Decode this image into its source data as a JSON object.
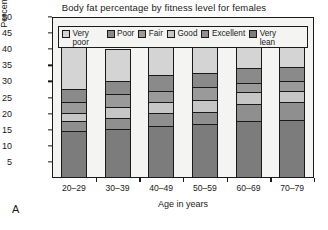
{
  "panel_label": "A",
  "chart_data": {
    "type": "bar",
    "stacked": true,
    "title": "Body fat percentage by fitness level for females",
    "xlabel": "Age in years",
    "ylabel": "Percent body fat",
    "categories": [
      "20–29",
      "30–39",
      "40–49",
      "50–59",
      "60–69",
      "70–79"
    ],
    "ylim": [
      0,
      50
    ],
    "yticks": [
      5,
      10,
      15,
      20,
      25,
      30,
      35,
      40,
      45,
      50
    ],
    "ytick_labels": [
      "5",
      "10",
      "15",
      "20",
      "25",
      "30",
      "35",
      "40",
      "45",
      "50"
    ],
    "grid": false,
    "legend_position": "top-inside",
    "series": [
      {
        "name": "Very lean",
        "color": "#7c7c7c",
        "values": [
          14.0,
          14.5,
          15.5,
          16.0,
          17.0,
          17.5
        ]
      },
      {
        "name": "Excellent",
        "color": "#8f8f8f",
        "values": [
          3.0,
          3.5,
          4.0,
          4.0,
          5.5,
          5.5
        ]
      },
      {
        "name": "Good",
        "color": "#c6c6c6",
        "values": [
          2.5,
          3.5,
          3.5,
          3.5,
          3.5,
          3.5
        ]
      },
      {
        "name": "Fair",
        "color": "#9a9a9a",
        "values": [
          3.5,
          4.0,
          3.5,
          4.0,
          3.0,
          3.0
        ]
      },
      {
        "name": "Poor",
        "color": "#8a8a8a",
        "values": [
          4.0,
          4.0,
          5.0,
          4.5,
          4.5,
          4.5
        ]
      },
      {
        "name": "Very poor",
        "color": "#d4d4d4",
        "values": [
          13.0,
          10.0,
          9.0,
          8.0,
          6.5,
          6.0
        ]
      }
    ],
    "legend": [
      {
        "label": "Very poor",
        "color": "#d4d4d4"
      },
      {
        "label": "Poor",
        "color": "#8a8a8a"
      },
      {
        "label": "Fair",
        "color": "#9a9a9a"
      },
      {
        "label": "Good",
        "color": "#c6c6c6"
      },
      {
        "label": "Excellent",
        "color": "#8f8f8f"
      },
      {
        "label": "Very lean",
        "color": "#7c7c7c"
      }
    ]
  }
}
